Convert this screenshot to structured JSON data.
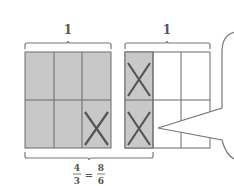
{
  "diagram": {
    "left_whole": {
      "label": "1",
      "columns": 3,
      "rows": 2,
      "shaded_cells": 6,
      "crossed_cells": 1
    },
    "right_whole": {
      "label": "1",
      "columns": 3,
      "rows": 2,
      "shaded_cells": 2,
      "crossed_cells": 2
    },
    "bottom_label": {
      "left_num": "4",
      "left_den": "3",
      "equals": "=",
      "right_num": "8",
      "right_den": "6"
    },
    "colors": {
      "shade": "#c8c8c8",
      "line": "#6b6b6b",
      "cross": "#555555",
      "background": "#ffffff"
    }
  }
}
